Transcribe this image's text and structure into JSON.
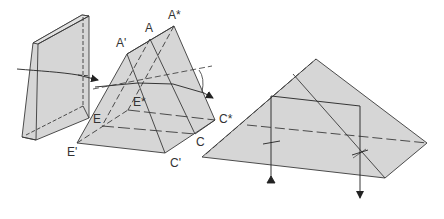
{
  "figure": {
    "colors": {
      "fill": "#d6d6d6",
      "stroke": "#3a3a3a",
      "label": "#333333"
    }
  },
  "labels": {
    "a_prime": "A'",
    "a": "A",
    "a_star": "A*",
    "e_star": "E*",
    "e": "E",
    "e_prime": "E'",
    "c_prime": "C'",
    "c": "C",
    "c_star": "C*"
  }
}
